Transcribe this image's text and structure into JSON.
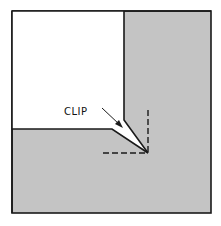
{
  "diagram": {
    "label": "CLIP",
    "colors": {
      "background": "#ffffff",
      "shaded_region": "#c4c4c4",
      "stroke": "#1a1a1a"
    },
    "parts": [
      "outer-square",
      "white-folded-panel",
      "clip-notch",
      "fold-guide-dashed-lines",
      "clip-pointer-arrow"
    ]
  }
}
